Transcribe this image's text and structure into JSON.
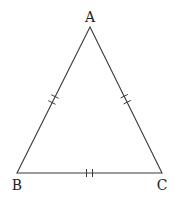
{
  "diagram": {
    "type": "equilateral-triangle",
    "stroke_color": "#3a3a3a",
    "vertices": {
      "A": {
        "label": "A",
        "x": 90,
        "y": 27
      },
      "B": {
        "label": "B",
        "x": 17,
        "y": 173
      },
      "C": {
        "label": "C",
        "x": 162,
        "y": 173
      }
    },
    "sides": [
      {
        "name": "AB",
        "tick_marks": 2
      },
      {
        "name": "AC",
        "tick_marks": 2
      },
      {
        "name": "BC",
        "tick_marks": 2
      }
    ]
  }
}
